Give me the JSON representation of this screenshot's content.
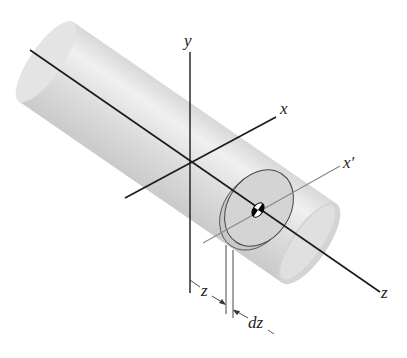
{
  "figure": {
    "type": "3D isometric diagram of a cylinder with coordinate axes and a thin disk element",
    "labels": {
      "y_axis": "y",
      "x_axis": "x",
      "x_prime_axis": "x′",
      "z_axis": "z",
      "z_dimension": "z",
      "dz_dimension": "dz"
    },
    "colors": {
      "background": "#ffffff",
      "cylinder_fill": "#dedede",
      "cylinder_highlight": "#f2f2f2",
      "axis_line": "#1a1a1a",
      "secondary_axis": "#8a8a8a",
      "disk_fill": "#d0d0d0"
    }
  }
}
